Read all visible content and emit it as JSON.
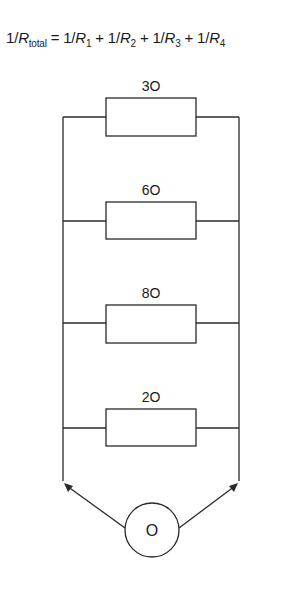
{
  "formula": {
    "lhs_prefix": "1/",
    "lhs_var": "R",
    "lhs_sub": "total",
    "equals": " = ",
    "terms": [
      {
        "prefix": "1/",
        "var": "R",
        "sub": "1",
        "sep": " + "
      },
      {
        "prefix": "1/",
        "var": "R",
        "sub": "2",
        "sep": " + "
      },
      {
        "prefix": "1/",
        "var": "R",
        "sub": "3",
        "sep": " + "
      },
      {
        "prefix": "1/",
        "var": "R",
        "sub": "4",
        "sep": ""
      }
    ]
  },
  "circuit": {
    "type": "parallel",
    "resistors": [
      {
        "label": "3O"
      },
      {
        "label": "6O"
      },
      {
        "label": "8O"
      },
      {
        "label": "2O"
      }
    ],
    "meter": {
      "label": "O"
    }
  }
}
